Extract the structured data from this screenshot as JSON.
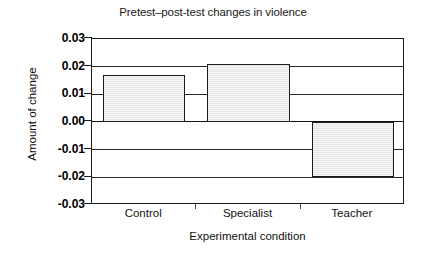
{
  "chart_data": {
    "type": "bar",
    "title": "Pretest–post-test changes in violence",
    "xlabel": "Experimental condition",
    "ylabel": "Amount of change",
    "categories": [
      "Control",
      "Specialist",
      "Teacher"
    ],
    "values": [
      0.017,
      0.021,
      -0.02
    ],
    "ylim": [
      -0.03,
      0.03
    ],
    "ytick_labels": [
      "0.03",
      "0.02",
      "0.01",
      "0.00",
      "-0.01",
      "-0.02",
      "-0.03"
    ],
    "ytick_values": [
      0.03,
      0.02,
      0.01,
      0.0,
      -0.01,
      -0.02,
      -0.03
    ],
    "grid": true,
    "legend": false,
    "bar_fill_color": "#e2e2e2",
    "bar_edge_color": "#1b1b1b",
    "axis_color": "#1b1b1b",
    "background_color": "#ffffff"
  },
  "axis": {
    "y_title": "Amount of change",
    "x_title": "Experimental condition"
  },
  "title": "Pretest–post-test changes in violence",
  "ticks": {
    "y": [
      "0.03",
      "0.02",
      "0.01",
      "0.00",
      "-0.01",
      "-0.02",
      "-0.03"
    ],
    "x": [
      "Control",
      "Specialist",
      "Teacher"
    ]
  }
}
